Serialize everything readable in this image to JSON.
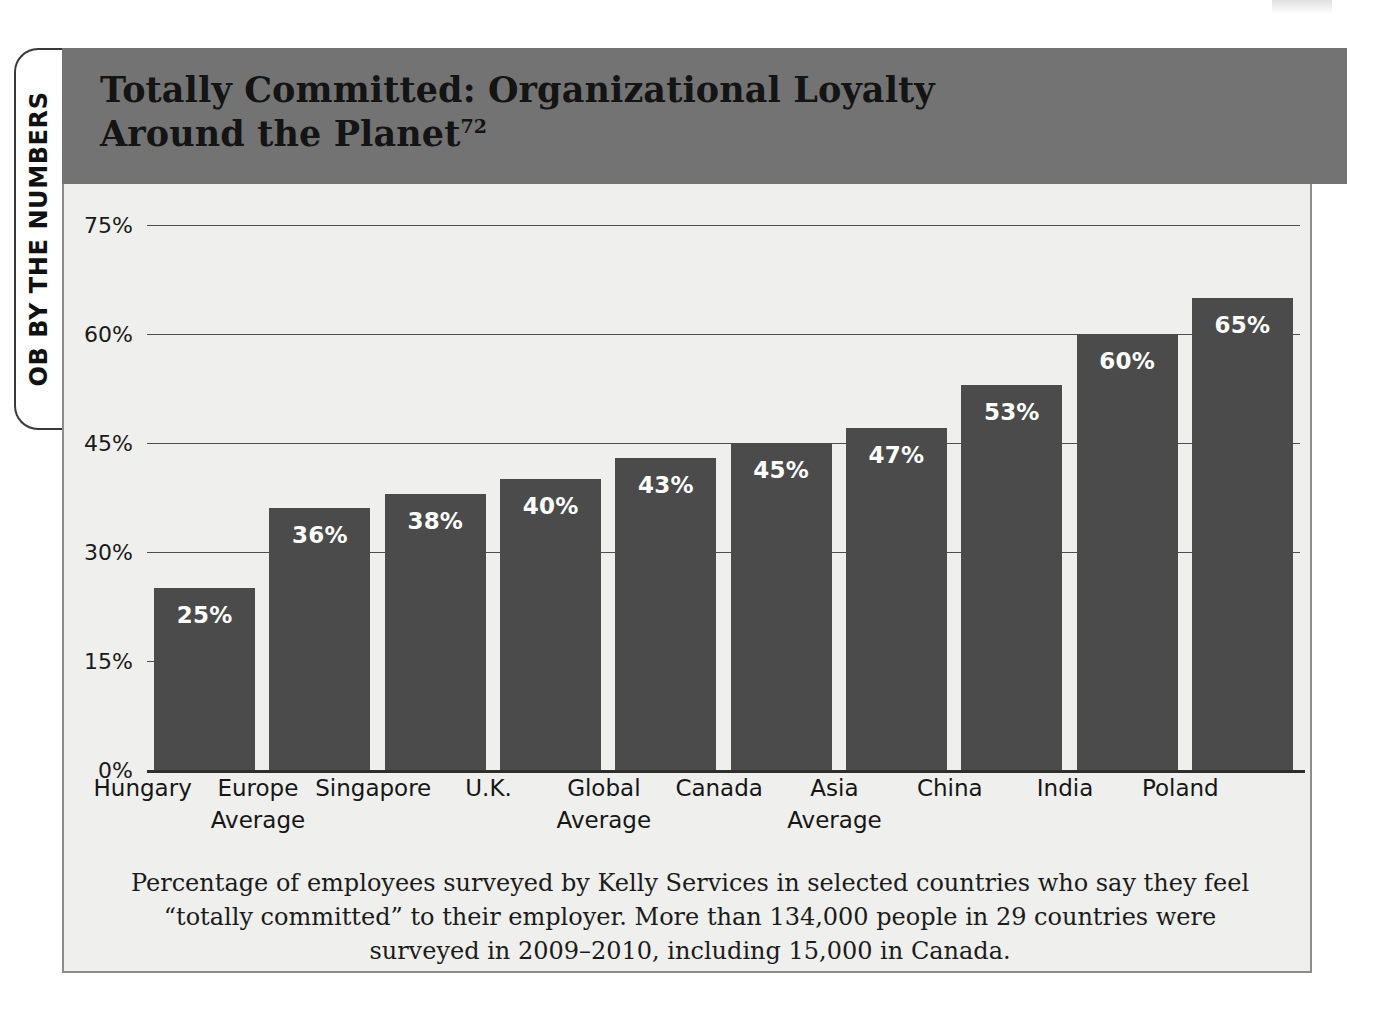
{
  "side_tab": {
    "label": "OB BY THE NUMBERS"
  },
  "header": {
    "title_line1": "Totally Committed: Organizational Loyalty",
    "title_line2": "Around the Planet",
    "title_superscript": "72",
    "band_color": "#737373"
  },
  "caption": {
    "text": "Percentage of employees surveyed by Kelly Services in selected countries who say they feel “totally committed” to their employer. More than 134,000 people in 29 countries were surveyed in 2009–2010, including 15,000 in Canada."
  },
  "colors": {
    "bar": "#4b4b4b",
    "plot_background": "#efefed",
    "frame_border": "#8c8c8c",
    "gridline": "#4d4d4d",
    "value_label": "#ffffff"
  },
  "chart_data": {
    "type": "bar",
    "title": "Totally Committed: Organizational Loyalty Around the Planet",
    "xlabel": "",
    "ylabel": "",
    "ylim": [
      0,
      75
    ],
    "yticks": [
      0,
      15,
      30,
      45,
      60,
      75
    ],
    "ytick_labels": [
      "0%",
      "15%",
      "30%",
      "45%",
      "60%",
      "75%"
    ],
    "grid": true,
    "legend": "none",
    "categories": [
      "Hungary",
      "Europe Average",
      "Singapore",
      "U.K.",
      "Global Average",
      "Canada",
      "Asia Average",
      "China",
      "India",
      "Poland"
    ],
    "category_lines": [
      [
        "Hungary"
      ],
      [
        "Europe",
        "Average"
      ],
      [
        "Singapore"
      ],
      [
        "U.K."
      ],
      [
        "Global",
        "Average"
      ],
      [
        "Canada"
      ],
      [
        "Asia",
        "Average"
      ],
      [
        "China"
      ],
      [
        "India"
      ],
      [
        "Poland"
      ]
    ],
    "values": [
      25,
      36,
      38,
      40,
      43,
      45,
      47,
      53,
      60,
      65
    ],
    "data_labels": [
      "25%",
      "36%",
      "38%",
      "40%",
      "43%",
      "45%",
      "47%",
      "53%",
      "60%",
      "65%"
    ]
  }
}
